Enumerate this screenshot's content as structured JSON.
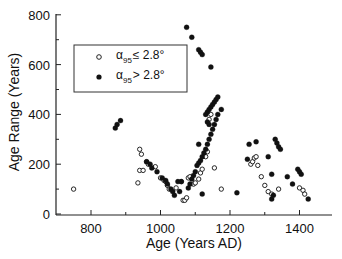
{
  "chart_data": {
    "type": "scatter",
    "title": "",
    "xlabel": "Age (Years AD)",
    "ylabel": "Age Range (Years)",
    "xlim": [
      700,
      1500
    ],
    "ylim": [
      0,
      800
    ],
    "x_ticks": [
      800,
      1000,
      1200,
      1400
    ],
    "x_minor_ticks": [
      900,
      1100,
      1300,
      1500
    ],
    "y_ticks": [
      0,
      200,
      400,
      600,
      800
    ],
    "y_minor_ticks": [
      100,
      300,
      500,
      700
    ],
    "grid": false,
    "legend_position": "upper-left",
    "series": [
      {
        "name": "α95 ≤ 2.8°",
        "marker": "open-circle",
        "points": [
          [
            750,
            100
          ],
          [
            940,
            260
          ],
          [
            945,
            240
          ],
          [
            940,
            175
          ],
          [
            950,
            175
          ],
          [
            935,
            125
          ],
          [
            960,
            210
          ],
          [
            965,
            200
          ],
          [
            985,
            190
          ],
          [
            1000,
            145
          ],
          [
            1010,
            135
          ],
          [
            1015,
            130
          ],
          [
            1020,
            115
          ],
          [
            1025,
            100
          ],
          [
            1045,
            105
          ],
          [
            1060,
            130
          ],
          [
            1065,
            55
          ],
          [
            1070,
            55
          ],
          [
            1075,
            65
          ],
          [
            1080,
            145
          ],
          [
            1085,
            150
          ],
          [
            1095,
            120
          ],
          [
            1100,
            125
          ],
          [
            1110,
            140
          ],
          [
            1115,
            165
          ],
          [
            1120,
            180
          ],
          [
            1130,
            230
          ],
          [
            1135,
            250
          ],
          [
            1140,
            380
          ],
          [
            1145,
            400
          ],
          [
            1155,
            185
          ],
          [
            1175,
            100
          ],
          [
            1260,
            200
          ],
          [
            1265,
            210
          ],
          [
            1270,
            225
          ],
          [
            1275,
            230
          ],
          [
            1280,
            195
          ],
          [
            1290,
            150
          ],
          [
            1300,
            115
          ],
          [
            1310,
            90
          ],
          [
            1320,
            80
          ],
          [
            1340,
            100
          ],
          [
            1400,
            105
          ],
          [
            1410,
            95
          ],
          [
            1415,
            80
          ]
        ]
      },
      {
        "name": "α95 > 2.8°",
        "marker": "filled-circle",
        "points": [
          [
            870,
            345
          ],
          [
            875,
            360
          ],
          [
            885,
            375
          ],
          [
            960,
            210
          ],
          [
            970,
            200
          ],
          [
            975,
            185
          ],
          [
            990,
            170
          ],
          [
            1005,
            145
          ],
          [
            1015,
            135
          ],
          [
            1020,
            120
          ],
          [
            1030,
            100
          ],
          [
            1035,
            90
          ],
          [
            1040,
            75
          ],
          [
            1050,
            130
          ],
          [
            1060,
            130
          ],
          [
            1075,
            750
          ],
          [
            1090,
            710
          ],
          [
            1110,
            660
          ],
          [
            1115,
            650
          ],
          [
            1120,
            640
          ],
          [
            1145,
            590
          ],
          [
            1055,
            90
          ],
          [
            1080,
            105
          ],
          [
            1085,
            120
          ],
          [
            1090,
            140
          ],
          [
            1095,
            155
          ],
          [
            1100,
            170
          ],
          [
            1105,
            195
          ],
          [
            1110,
            205
          ],
          [
            1115,
            215
          ],
          [
            1120,
            230
          ],
          [
            1125,
            245
          ],
          [
            1130,
            260
          ],
          [
            1135,
            280
          ],
          [
            1140,
            300
          ],
          [
            1145,
            320
          ],
          [
            1150,
            340
          ],
          [
            1155,
            360
          ],
          [
            1160,
            380
          ],
          [
            1165,
            400
          ],
          [
            1130,
            400
          ],
          [
            1135,
            410
          ],
          [
            1140,
            420
          ],
          [
            1145,
            430
          ],
          [
            1150,
            440
          ],
          [
            1155,
            450
          ],
          [
            1160,
            460
          ],
          [
            1165,
            470
          ],
          [
            1135,
            370
          ],
          [
            1140,
            360
          ],
          [
            1110,
            280
          ],
          [
            1175,
            420
          ],
          [
            1120,
            80
          ],
          [
            1220,
            85
          ],
          [
            1250,
            220
          ],
          [
            1255,
            280
          ],
          [
            1275,
            290
          ],
          [
            1310,
            230
          ],
          [
            1320,
            60
          ],
          [
            1325,
            75
          ],
          [
            1320,
            160
          ],
          [
            1330,
            300
          ],
          [
            1335,
            285
          ],
          [
            1340,
            270
          ],
          [
            1345,
            260
          ],
          [
            1365,
            150
          ],
          [
            1380,
            120
          ],
          [
            1395,
            180
          ],
          [
            1400,
            170
          ],
          [
            1405,
            160
          ],
          [
            1425,
            60
          ]
        ]
      }
    ]
  },
  "legend": {
    "items": [
      {
        "symbol": "α",
        "subscript": "95",
        "relation": "≤ 2.8°",
        "marker": "open"
      },
      {
        "symbol": "α",
        "subscript": "95",
        "relation": "> 2.8°",
        "marker": "filled"
      }
    ]
  },
  "axes": {
    "x": {
      "title": "Age (Years AD)",
      "labels": [
        "800",
        "1000",
        "1200",
        "1400"
      ]
    },
    "y": {
      "title": "Age Range (Years)",
      "labels": [
        "0",
        "200",
        "400",
        "600",
        "800"
      ]
    }
  }
}
